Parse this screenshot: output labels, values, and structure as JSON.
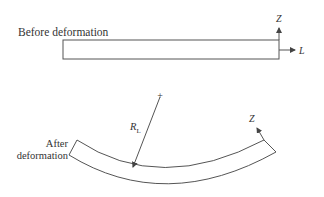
{
  "diagram": {
    "before": {
      "label": "Before deformation",
      "axis_z_label": "Z",
      "axis_l_label": "L"
    },
    "after": {
      "label_line1": "After",
      "label_line2": "deformation",
      "radius_label_main": "R",
      "radius_label_sub": "L",
      "center_marker": "+",
      "axis_z_label": "Z"
    },
    "colors": {
      "line": "#555555",
      "text": "#333333",
      "background": "#ffffff"
    }
  }
}
